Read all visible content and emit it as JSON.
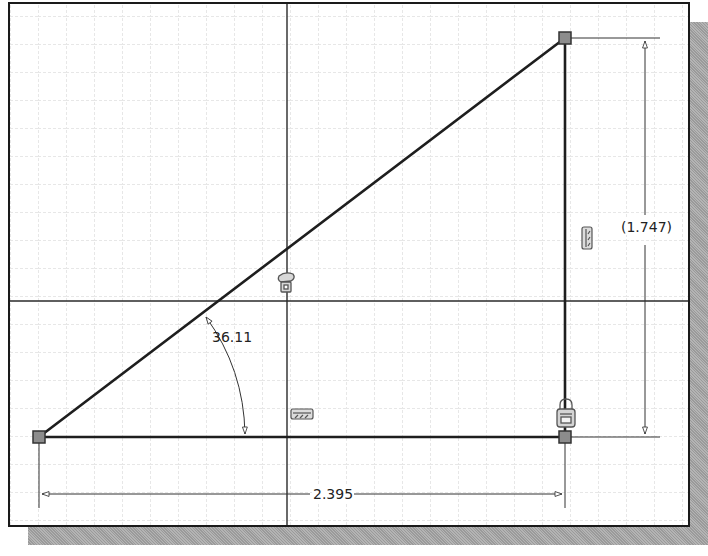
{
  "sketch": {
    "grid_spacing_px": 28,
    "colors": {
      "grid": "#c8c8c8",
      "geometry": "#1e1e1e",
      "dimension": "#333333",
      "point_fill": "#8c8c8c",
      "constraint_glyph": "#6e6e6e",
      "shadow": "#a8a8a8"
    },
    "points": [
      {
        "id": "p-bottom-left",
        "x": 39,
        "y": 437
      },
      {
        "id": "p-top-right",
        "x": 565,
        "y": 38
      },
      {
        "id": "p-bottom-right",
        "x": 565,
        "y": 437
      }
    ],
    "lines": [
      {
        "id": "hypotenuse",
        "from": "p-bottom-left",
        "to": "p-top-right"
      },
      {
        "id": "base",
        "from": "p-bottom-left",
        "to": "p-bottom-right"
      },
      {
        "id": "vertical-side",
        "from": "p-bottom-right",
        "to": "p-top-right"
      }
    ],
    "axes": {
      "origin_x": 287,
      "origin_y": 301
    }
  },
  "dimensions": {
    "horizontal": {
      "label": "2.395",
      "type": "linear",
      "driven": false
    },
    "vertical": {
      "label": "(1.747)",
      "type": "linear",
      "driven": true
    },
    "angle": {
      "label": "36.11",
      "type": "angular",
      "driven": false
    }
  },
  "constraints": [
    {
      "type": "horizontal",
      "icon": "horizontal-constraint-icon",
      "applies_to": "base"
    },
    {
      "type": "vertical",
      "icon": "vertical-constraint-icon",
      "applies_to": "vertical-side"
    },
    {
      "type": "coincident",
      "icon": "coincident-constraint-icon",
      "applies_to": "hypotenuse-axis"
    },
    {
      "type": "fix",
      "icon": "fix-lock-icon",
      "applies_to": "p-bottom-right"
    }
  ]
}
